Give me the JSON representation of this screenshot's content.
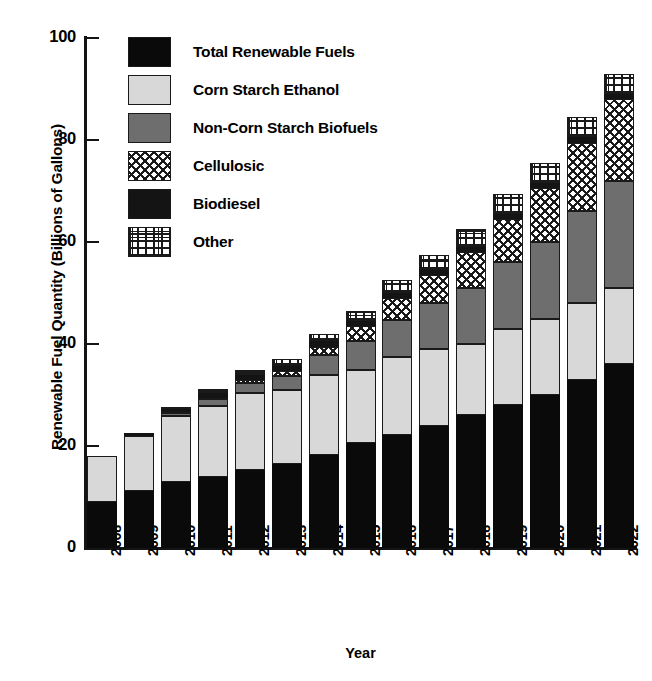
{
  "chart_data": {
    "type": "bar",
    "subtype": "stacked",
    "title": "",
    "xlabel": "Year",
    "ylabel": "Renewable Fuel Quantity (Billions of Gallons)",
    "ylim": [
      0,
      100
    ],
    "yticks": [
      0,
      20,
      40,
      60,
      80,
      100
    ],
    "ytick_labels": [
      "0",
      "20",
      "40",
      "60",
      "80",
      "100"
    ],
    "grid": false,
    "legend_position": "upper left inside",
    "categories": [
      "2008",
      "2009",
      "2010",
      "2011",
      "2012",
      "2013",
      "2014",
      "2015",
      "2016",
      "2017",
      "2018",
      "2019",
      "2020",
      "2021",
      "2022"
    ],
    "series": [
      {
        "name": "Total Renewable Fuels",
        "pattern": "solid-black",
        "color": "#0a0a0a",
        "values": [
          9.0,
          11.1,
          12.95,
          13.95,
          15.2,
          16.55,
          18.15,
          20.5,
          22.25,
          24.0,
          26.0,
          28.0,
          30.0,
          33.0,
          36.0
        ]
      },
      {
        "name": "Corn Starch Ethanol",
        "pattern": "light-gray",
        "color": "#d8d8d8",
        "values": [
          9.0,
          10.9,
          12.95,
          13.95,
          15.2,
          14.45,
          15.85,
          14.5,
          15.25,
          15.0,
          14.0,
          15.0,
          15.0,
          15.0,
          15.0
        ]
      },
      {
        "name": "Non-Corn Starch Biofuels",
        "pattern": "dark-gray",
        "color": "#6e6e6e",
        "values": [
          0.0,
          0.0,
          0.6,
          1.35,
          2.0,
          2.75,
          3.75,
          5.5,
          7.25,
          9.0,
          11.0,
          13.0,
          15.0,
          18.0,
          21.0
        ]
      },
      {
        "name": "Cellulosic",
        "pattern": "crosshatch",
        "color": "#ffffff",
        "values": [
          0.0,
          0.0,
          0.1,
          0.25,
          0.5,
          1.0,
          1.75,
          3.0,
          4.25,
          5.5,
          7.0,
          8.5,
          10.5,
          13.5,
          16.0
        ]
      },
      {
        "name": "Biodiesel",
        "pattern": "solid-black-thin",
        "color": "#141414",
        "values": [
          0.0,
          0.5,
          0.65,
          0.8,
          1.0,
          1.0,
          1.0,
          1.0,
          1.0,
          1.0,
          1.0,
          1.0,
          1.0,
          1.0,
          1.0
        ]
      },
      {
        "name": "Other",
        "pattern": "grid",
        "color": "#ffffff",
        "values": [
          0.0,
          0.0,
          0.45,
          0.8,
          1.0,
          1.25,
          1.5,
          2.0,
          2.5,
          3.0,
          3.5,
          4.0,
          4.0,
          4.0,
          4.0
        ]
      }
    ],
    "totals": [
      18.0,
      22.0,
      26.75,
      28.0,
      30.9,
      33.0,
      36.0,
      40.5,
      44.75,
      48.5,
      53.0,
      58.0,
      63.5,
      71.5,
      80.0
    ],
    "bar_tops": [
      18.0,
      22.0,
      26.5,
      28.0,
      30.9,
      33.0,
      36.0,
      40.5,
      44.75,
      48.5,
      53.0,
      58.0,
      63.5,
      71.5,
      80.0
    ]
  },
  "axes": {
    "y_title": "Renewable Fuel Quantity (Billions of Gallons)",
    "x_title": "Year",
    "y_tick_labels": [
      "100",
      "80",
      "60",
      "40",
      "20",
      "0"
    ],
    "x_tick_labels": [
      "2008",
      "2009",
      "2010",
      "2011",
      "2012",
      "2013",
      "2014",
      "2015",
      "2016",
      "2017",
      "2018",
      "2019",
      "2020",
      "2021",
      "2022"
    ]
  },
  "legend": {
    "items": [
      {
        "label": "Total Renewable Fuels",
        "pattern": "solid-black"
      },
      {
        "label": "Corn Starch Ethanol",
        "pattern": "light-gray"
      },
      {
        "label": "Non-Corn Starch Biofuels",
        "pattern": "dark-gray"
      },
      {
        "label": "Cellulosic",
        "pattern": "crosshatch"
      },
      {
        "label": "Biodiesel",
        "pattern": "biodiesel"
      },
      {
        "label": "Other",
        "pattern": "grid"
      }
    ]
  },
  "colors": {
    "axis": "#141414",
    "total_renewable_fuels": "#0a0a0a",
    "corn_starch_ethanol": "#d8d8d8",
    "non_corn_starch_biofuels": "#6e6e6e",
    "cellulosic": "#ffffff",
    "biodiesel": "#141414",
    "other": "#ffffff"
  }
}
